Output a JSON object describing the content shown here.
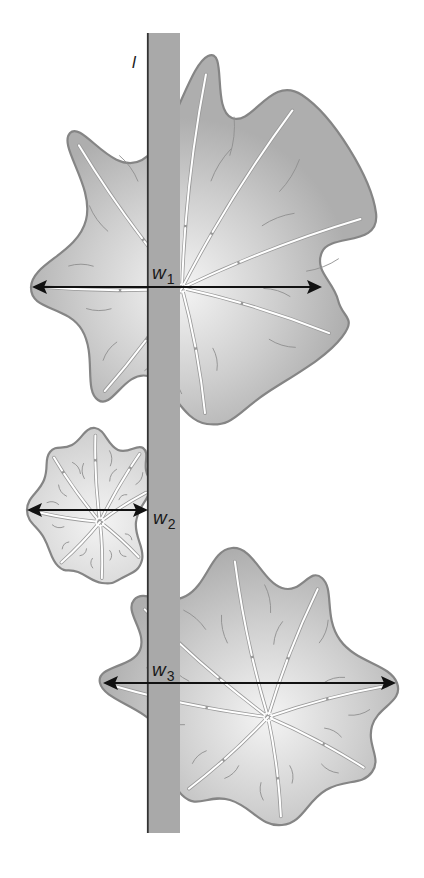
{
  "figure": {
    "background": "#ffffff",
    "bar": {
      "label": "l",
      "x": 147,
      "y": 33,
      "width": 33,
      "height": 800,
      "fill": "#a9a9a9",
      "edge": "#333333"
    },
    "colors": {
      "blob_outline": "#858585",
      "blob_center": "#f4f4f4",
      "blob_edge": "#aeaeae",
      "rib": "#ffffff",
      "rib_shadow": "#9a9a9a",
      "arrow": "#111111"
    },
    "blobs": [
      {
        "name": "large-top-blob",
        "center": [
          182,
          288
        ],
        "tips": [
          [
            208,
            56
          ],
          [
            302,
            95
          ],
          [
            376,
            213
          ],
          [
            342,
            337
          ],
          [
            207,
            424
          ],
          [
            98,
            400
          ],
          [
            31,
            287
          ],
          [
            70,
            133
          ]
        ],
        "valleys": [
          [
            232,
            118
          ],
          [
            338,
            300
          ],
          [
            322,
            252
          ],
          [
            268,
            392
          ],
          [
            148,
            376
          ],
          [
            82,
            330
          ],
          [
            86,
            220
          ],
          [
            142,
            160
          ]
        ]
      },
      {
        "name": "small-middle-blob",
        "center": [
          100,
          522
        ],
        "tips": [
          [
            95,
            428
          ],
          [
            143,
            448
          ],
          [
            150,
            490
          ],
          [
            142,
            560
          ],
          [
            102,
            583
          ],
          [
            58,
            566
          ],
          [
            27,
            510
          ],
          [
            50,
            452
          ]
        ],
        "valleys": [
          [
            118,
            450
          ],
          [
            146,
            470
          ],
          [
            136,
            522
          ],
          [
            122,
            578
          ],
          [
            78,
            572
          ],
          [
            44,
            538
          ],
          [
            44,
            480
          ],
          [
            72,
            445
          ]
        ]
      },
      {
        "name": "large-bottom-blob",
        "center": [
          268,
          717
        ],
        "tips": [
          [
            232,
            548
          ],
          [
            322,
            578
          ],
          [
            397,
            683
          ],
          [
            372,
            772
          ],
          [
            282,
            825
          ],
          [
            182,
            795
          ],
          [
            100,
            683
          ],
          [
            134,
            600
          ]
        ],
        "valleys": [
          [
            282,
            588
          ],
          [
            340,
            640
          ],
          [
            372,
            726
          ],
          [
            326,
            790
          ],
          [
            230,
            800
          ],
          [
            160,
            730
          ],
          [
            140,
            650
          ],
          [
            186,
            596
          ]
        ]
      }
    ],
    "measurements": [
      {
        "name": "w1",
        "letter": "w",
        "subscript": "1",
        "x1": 32,
        "x2": 322,
        "y": 287,
        "label_x": 152,
        "label_y": 279
      },
      {
        "name": "w2",
        "letter": "w",
        "subscript": "2",
        "x1": 27,
        "x2": 148,
        "y": 510,
        "label_x": 153,
        "label_y": 524
      },
      {
        "name": "w3",
        "letter": "w",
        "subscript": "3",
        "x1": 103,
        "x2": 396,
        "y": 683,
        "label_x": 152,
        "label_y": 676
      }
    ]
  }
}
